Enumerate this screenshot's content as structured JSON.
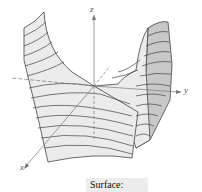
{
  "figure": {
    "type": "3d-surface",
    "axes": {
      "x": "x",
      "y": "y",
      "z": "z"
    },
    "colors": {
      "surface_light": "#ebebeb",
      "surface_dark": "#c8c8c8",
      "line": "#444444",
      "axis": "#777777"
    }
  },
  "caption": {
    "label": "Surface:"
  }
}
